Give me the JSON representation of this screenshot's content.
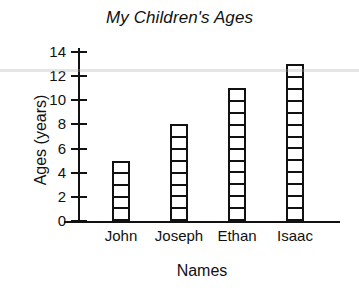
{
  "chart_data": {
    "type": "bar",
    "title": "My Children's Ages",
    "xlabel": "Names",
    "ylabel": "Ages (years)",
    "categories": [
      "John",
      "Joseph",
      "Ethan",
      "Isaac"
    ],
    "values": [
      5,
      8,
      11,
      13
    ],
    "ylim": [
      0,
      14
    ],
    "ytick_labels": [
      "0",
      "2",
      "4",
      "6",
      "8",
      "10",
      "12",
      "14"
    ],
    "ytick_values": [
      0,
      2,
      4,
      6,
      8,
      10,
      12,
      14
    ],
    "grid": false,
    "legend": null,
    "bar_style": "unit-segmented-outline",
    "colors": {
      "background": "#ffffff",
      "axis": "#111111",
      "bar_fill": "#ffffff",
      "bar_outline": "#111111",
      "text": "#111111"
    }
  }
}
